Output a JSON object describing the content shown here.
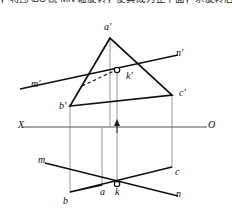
{
  "header": {
    "text": "，将△ABC 绕 MN 轴旋转，使其成为正平面，求旋转后的投影。"
  },
  "figure": {
    "colors": {
      "stroke": "#111111",
      "axis": "#555555",
      "projector": "#8a8a8a",
      "background": "#ffffff"
    },
    "axis": {
      "left_label": "X",
      "right_label": "O",
      "y": 127
    },
    "labels": {
      "a_prime": "a'",
      "b_prime": "b'",
      "c_prime": "c'",
      "k_prime": "k'",
      "m_prime": "m'",
      "n_prime": "n'",
      "a": "a",
      "b": "b",
      "c": "c",
      "k": "k",
      "m": "m",
      "n": "n"
    },
    "points": {
      "a_prime": [
        110,
        36
      ],
      "b_prime": [
        70,
        106
      ],
      "c_prime": [
        172,
        95
      ],
      "k_prime": [
        117,
        71
      ],
      "m_prime_end": [
        20,
        89
      ],
      "n_prime_end": [
        178,
        55
      ],
      "a": [
        102,
        185
      ],
      "b": [
        70,
        192
      ],
      "c": [
        172,
        167
      ],
      "k": [
        117,
        185
      ],
      "m_end": [
        45,
        163
      ],
      "n_end": [
        178,
        196
      ]
    },
    "verticals": [
      70,
      102,
      110,
      117,
      172
    ]
  }
}
